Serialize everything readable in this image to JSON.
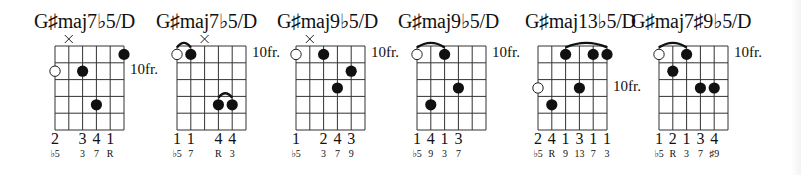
{
  "colors": {
    "ink": "#111111",
    "background": "#ffffff"
  },
  "chords": [
    {
      "name": "G♯maj7♭5/D",
      "grid_left": 55,
      "title_left": 34,
      "fret_label": "10fr.",
      "fret_label_row": 1,
      "fret_label_side": "right",
      "muted": [
        1
      ],
      "open": [
        {
          "string": 0,
          "row": 1
        }
      ],
      "dots": [
        {
          "string": 5,
          "row": 0
        },
        {
          "string": 2,
          "row": 1
        },
        {
          "string": 3,
          "row": 3
        }
      ],
      "barres": [],
      "fingers": [
        "2",
        "",
        "3",
        "4",
        "1",
        ""
      ],
      "degrees": [
        "♭5",
        "",
        "3",
        "7",
        "R",
        ""
      ]
    },
    {
      "name": "G♯maj7♭5/D",
      "grid_left": 177,
      "title_left": 156,
      "fret_label": "10fr.",
      "fret_label_row": 0,
      "fret_label_side": "right",
      "left_fret_label": "10fr.",
      "muted": [
        2
      ],
      "open": [
        {
          "string": 0,
          "row": 0
        }
      ],
      "dots": [
        {
          "string": 1,
          "row": 0
        },
        {
          "string": 3,
          "row": 3
        },
        {
          "string": 4,
          "row": 3
        }
      ],
      "barres": [
        {
          "from": 0,
          "to": 1,
          "row": 0
        },
        {
          "from": 3,
          "to": 4,
          "row": 3
        }
      ],
      "fingers": [
        "1",
        "1",
        "",
        "4",
        "4",
        ""
      ],
      "degrees": [
        "♭5",
        "7",
        "",
        "R",
        "3",
        ""
      ]
    },
    {
      "name": "G♯maj9♭5/D",
      "grid_left": 296,
      "title_left": 277,
      "fret_label": "10fr.",
      "fret_label_row": 0,
      "fret_label_side": "right",
      "muted": [
        1
      ],
      "open": [
        {
          "string": 0,
          "row": 0
        }
      ],
      "dots": [
        {
          "string": 2,
          "row": 0
        },
        {
          "string": 4,
          "row": 1
        },
        {
          "string": 3,
          "row": 2
        }
      ],
      "barres": [],
      "fingers": [
        "1",
        "",
        "2",
        "4",
        "3",
        ""
      ],
      "degrees": [
        "♭5",
        "",
        "3",
        "7",
        "9",
        ""
      ]
    },
    {
      "name": "G♯maj9♭5/D",
      "grid_left": 417,
      "title_left": 398,
      "fret_label": "10fr.",
      "fret_label_row": 0,
      "fret_label_side": "right",
      "muted": [],
      "open": [
        {
          "string": 0,
          "row": 0
        }
      ],
      "dots": [
        {
          "string": 2,
          "row": 0
        },
        {
          "string": 3,
          "row": 2
        },
        {
          "string": 1,
          "row": 3
        }
      ],
      "barres": [
        {
          "from": 0,
          "to": 2,
          "row": 0
        }
      ],
      "fingers": [
        "1",
        "4",
        "1",
        "3",
        "",
        ""
      ],
      "degrees": [
        "♭5",
        "9",
        "3",
        "7",
        "",
        ""
      ]
    },
    {
      "name": "G♯maj13♭5/D",
      "grid_left": 538,
      "title_left": 525,
      "fret_label": "10fr.",
      "fret_label_row": 2,
      "fret_label_side": "right",
      "muted": [],
      "open": [
        {
          "string": 0,
          "row": 2
        }
      ],
      "dots": [
        {
          "string": 2,
          "row": 0
        },
        {
          "string": 4,
          "row": 0
        },
        {
          "string": 5,
          "row": 0
        },
        {
          "string": 3,
          "row": 2
        },
        {
          "string": 1,
          "row": 3
        }
      ],
      "barres": [
        {
          "from": 2,
          "to": 5,
          "row": 0
        }
      ],
      "fingers": [
        "2",
        "4",
        "1",
        "3",
        "1",
        "1"
      ],
      "degrees": [
        "♭5",
        "R",
        "9",
        "13",
        "7",
        "3"
      ]
    },
    {
      "name": "G♯maj7♯9♭5/D",
      "grid_left": 659,
      "title_left": 631,
      "fret_label": "10fr.",
      "fret_label_row": 0,
      "fret_label_side": "right",
      "muted": [],
      "open": [
        {
          "string": 0,
          "row": 0
        }
      ],
      "dots": [
        {
          "string": 2,
          "row": 0
        },
        {
          "string": 1,
          "row": 1
        },
        {
          "string": 3,
          "row": 2
        },
        {
          "string": 4,
          "row": 2
        }
      ],
      "barres": [
        {
          "from": 0,
          "to": 2,
          "row": 0
        }
      ],
      "fingers": [
        "1",
        "2",
        "1",
        "3",
        "4",
        ""
      ],
      "degrees": [
        "♭5",
        "R",
        "3",
        "7",
        "♯9",
        ""
      ]
    }
  ]
}
